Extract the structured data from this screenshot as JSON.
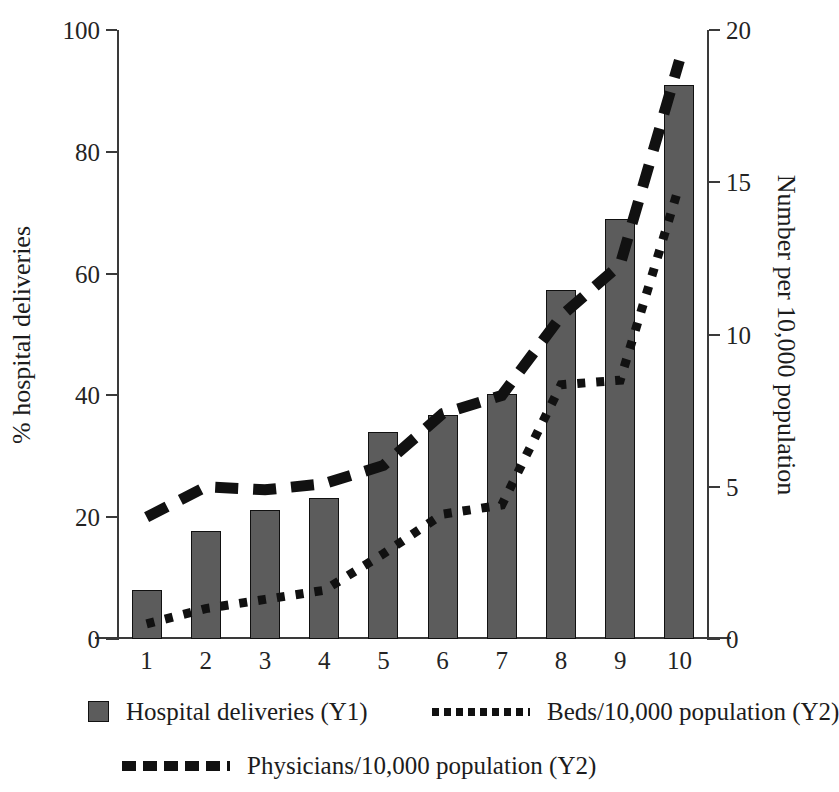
{
  "chart_data": {
    "type": "bar",
    "title": "",
    "categories": [
      "1",
      "2",
      "3",
      "4",
      "5",
      "6",
      "7",
      "8",
      "9",
      "10"
    ],
    "xlabel": "",
    "ylabel": "% hospital deliveries",
    "ylabel_right": "Number per 10,000 population",
    "ylim": [
      0,
      100
    ],
    "ylim_right": [
      0,
      20
    ],
    "yticks": [
      0,
      20,
      40,
      60,
      80,
      100
    ],
    "yticks_right": [
      0,
      5,
      10,
      15,
      20
    ],
    "grid": false,
    "legend_position": "bottom",
    "series": [
      {
        "name": "Hospital deliveries (Y1)",
        "axis": "left",
        "style": "bar",
        "color": "#5c5c5c",
        "values": [
          8,
          17.8,
          21.2,
          23.2,
          34,
          36.8,
          40.3,
          57.3,
          69,
          91
        ]
      },
      {
        "name": "Beds/10,000 population (Y2)",
        "axis": "right",
        "style": "dotted",
        "color": "#111111",
        "values": [
          0.5,
          1.0,
          1.3,
          1.6,
          2.8,
          4.1,
          4.4,
          8.35,
          8.5,
          14.9
        ]
      },
      {
        "name": "Physicians/10,000 population (Y2)",
        "axis": "right",
        "style": "dashed",
        "color": "#111111",
        "values": [
          4.0,
          5.0,
          4.9,
          5.1,
          5.7,
          7.4,
          8.0,
          10.6,
          12.3,
          19.0
        ]
      }
    ]
  },
  "axes": {
    "left_title": "% hospital deliveries",
    "right_title": "Number per 10,000 population",
    "left_ticks": [
      "0",
      "20",
      "40",
      "60",
      "80",
      "100"
    ],
    "right_ticks": [
      "0",
      "5",
      "10",
      "15",
      "20"
    ],
    "x_ticks": [
      "1",
      "2",
      "3",
      "4",
      "5",
      "6",
      "7",
      "8",
      "9",
      "10"
    ]
  },
  "legend": {
    "items": [
      {
        "label": "Hospital deliveries (Y1)",
        "marker": "filled-square"
      },
      {
        "label": "Beds/10,000 population (Y2)",
        "marker": "dotted-line"
      },
      {
        "label": "Physicians/10,000 population (Y2)",
        "marker": "dashed-line"
      }
    ]
  },
  "colors": {
    "bar_fill": "#5c5c5c",
    "bar_stroke": "#111111",
    "line": "#111111",
    "axis": "#3a3a3a",
    "text": "#1c1c1c",
    "background": "#ffffff"
  }
}
